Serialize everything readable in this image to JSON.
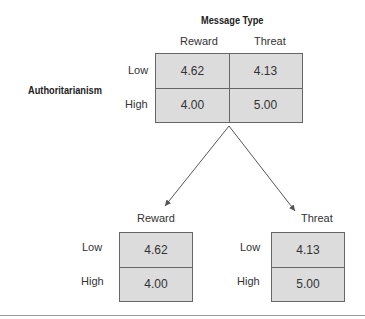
{
  "diagram": {
    "title": "Message Type",
    "row_factor_label": "Authoritarianism",
    "top_table": {
      "columns": [
        "Reward",
        "Threat"
      ],
      "rows": [
        {
          "label": "Low",
          "values": [
            "4.62",
            "4.13"
          ]
        },
        {
          "label": "High",
          "values": [
            "4.00",
            "5.00"
          ]
        }
      ]
    },
    "split_tables": [
      {
        "title": "Reward",
        "rows": [
          {
            "label": "Low",
            "value": "4.62"
          },
          {
            "label": "High",
            "value": "4.00"
          }
        ]
      },
      {
        "title": "Threat",
        "rows": [
          {
            "label": "Low",
            "value": "4.13"
          },
          {
            "label": "High",
            "value": "5.00"
          }
        ]
      }
    ],
    "colors": {
      "cell_fill": "#dcdcdc",
      "border": "#666666",
      "arrow": "#555555"
    }
  }
}
